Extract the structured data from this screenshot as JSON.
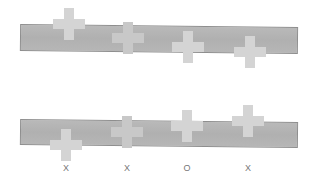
{
  "figure": {
    "type": "perceptual-comparison-diagram",
    "colors": {
      "background": "#ffffff",
      "bar_fill": "#b4b4b4",
      "bar_border": "#8e8e8e",
      "cross_fill": "#d4d4d4",
      "cross_faint": "#c6c6c6",
      "label": "#777777"
    },
    "panels": [
      {
        "name": "top",
        "bar": {
          "x": 20,
          "y": 24,
          "width": 278,
          "height": 27,
          "tilt_deg": 0.6
        },
        "crosses": [
          {
            "cx": 69,
            "cy": 24,
            "tone": "light"
          },
          {
            "cx": 128,
            "cy": 38,
            "tone": "faint"
          },
          {
            "cx": 188,
            "cy": 47,
            "tone": "light"
          },
          {
            "cx": 250,
            "cy": 52,
            "tone": "light"
          }
        ]
      },
      {
        "name": "bottom",
        "bar": {
          "x": 20,
          "y": 119,
          "width": 278,
          "height": 26,
          "tilt_deg": 0.6
        },
        "crosses": [
          {
            "cx": 66,
            "cy": 145,
            "tone": "light"
          },
          {
            "cx": 127,
            "cy": 132,
            "tone": "faint"
          },
          {
            "cx": 187,
            "cy": 126,
            "tone": "light"
          },
          {
            "cx": 248,
            "cy": 121,
            "tone": "light"
          }
        ]
      }
    ],
    "labels": [
      {
        "text": "X",
        "x": 66
      },
      {
        "text": "X",
        "x": 127
      },
      {
        "text": "O",
        "x": 187
      },
      {
        "text": "X",
        "x": 248
      }
    ]
  }
}
